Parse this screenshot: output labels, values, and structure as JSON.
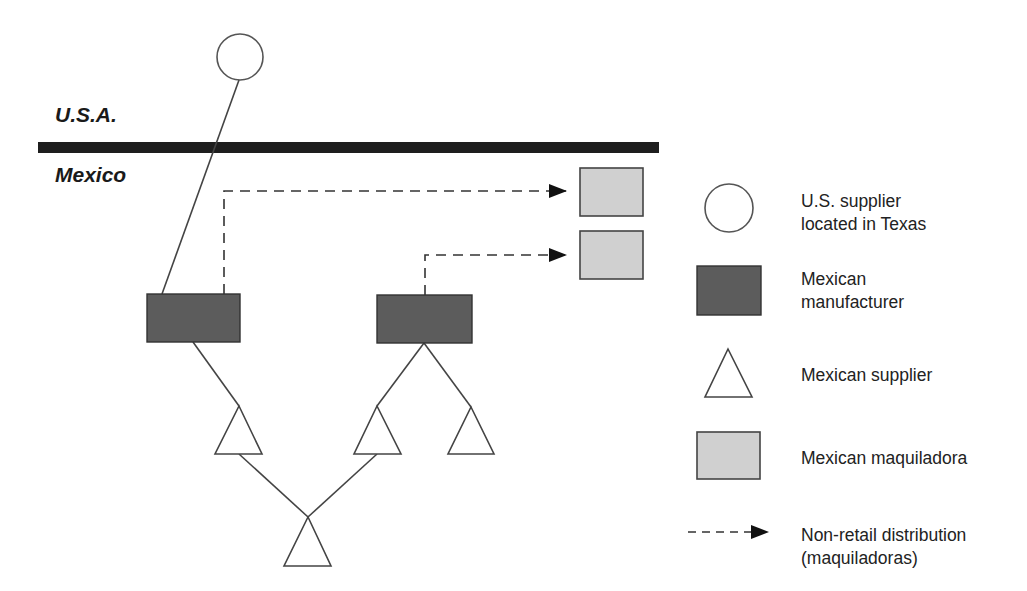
{
  "diagram": {
    "regions": {
      "top_label": "U.S.A.",
      "bottom_label": "Mexico"
    },
    "colors": {
      "border_bar": "#1e1e1e",
      "stroke": "#444444",
      "manufacturer_fill": "#5c5c5c",
      "maquiladora_fill": "#d0d0d0",
      "supplier_fill": "#ffffff",
      "arrow": "#111111"
    },
    "nodes": [
      {
        "id": "us-supplier",
        "type": "U.S. supplier located in Texas",
        "shape": "circle",
        "cx": 240,
        "cy": 57,
        "r": 23
      },
      {
        "id": "manufacturer-1",
        "type": "Mexican manufacturer",
        "shape": "rect",
        "x": 147,
        "y": 294,
        "w": 93,
        "h": 48
      },
      {
        "id": "manufacturer-2",
        "type": "Mexican manufacturer",
        "shape": "rect",
        "x": 377,
        "y": 295,
        "w": 95,
        "h": 48
      },
      {
        "id": "maquiladora-1",
        "type": "Mexican maquiladora",
        "shape": "rect",
        "x": 580,
        "y": 168,
        "w": 63,
        "h": 48
      },
      {
        "id": "maquiladora-2",
        "type": "Mexican maquiladora",
        "shape": "rect",
        "x": 580,
        "y": 231,
        "w": 63,
        "h": 48
      },
      {
        "id": "supplier-1",
        "type": "Mexican supplier",
        "shape": "triangle"
      },
      {
        "id": "supplier-2",
        "type": "Mexican supplier",
        "shape": "triangle"
      },
      {
        "id": "supplier-3",
        "type": "Mexican supplier",
        "shape": "triangle"
      },
      {
        "id": "supplier-4",
        "type": "Mexican supplier",
        "shape": "triangle"
      }
    ],
    "edges": [
      {
        "from": "us-supplier",
        "to": "manufacturer-1",
        "style": "solid"
      },
      {
        "from": "manufacturer-1",
        "to": "maquiladora-1",
        "style": "dashed-arrow"
      },
      {
        "from": "manufacturer-2",
        "to": "maquiladora-2",
        "style": "dashed-arrow"
      },
      {
        "from": "manufacturer-1",
        "to": "supplier-1",
        "style": "solid"
      },
      {
        "from": "manufacturer-2",
        "to": "supplier-2",
        "style": "solid"
      },
      {
        "from": "manufacturer-2",
        "to": "supplier-3",
        "style": "solid"
      },
      {
        "from": "supplier-1",
        "to": "supplier-4",
        "style": "solid"
      },
      {
        "from": "supplier-2",
        "to": "supplier-4",
        "style": "solid"
      }
    ]
  },
  "legend": {
    "items": [
      {
        "icon": "circle-icon",
        "label_line1": "U.S. supplier",
        "label_line2": "located in Texas"
      },
      {
        "icon": "dark-rect-icon",
        "label_line1": "Mexican",
        "label_line2": "manufacturer"
      },
      {
        "icon": "triangle-icon",
        "label_line1": "Mexican supplier",
        "label_line2": ""
      },
      {
        "icon": "light-rect-icon",
        "label_line1": "Mexican maquiladora",
        "label_line2": ""
      },
      {
        "icon": "dashed-arrow-icon",
        "label_line1": "Non-retail distribution",
        "label_line2": "(maquiladoras)"
      }
    ]
  }
}
